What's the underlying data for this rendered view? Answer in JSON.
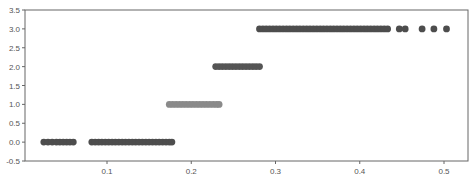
{
  "chart_data": {
    "type": "scatter",
    "title": "",
    "xlabel": "",
    "ylabel": "",
    "xlim": [
      0.0,
      0.53
    ],
    "ylim": [
      -0.5,
      3.5
    ],
    "grid": false,
    "legend": null,
    "x_ticks": [
      0.1,
      0.2,
      0.3,
      0.4,
      0.5
    ],
    "x_tick_labels": [
      "0.1",
      "0.2",
      "0.3",
      "0.4",
      "0.5"
    ],
    "y_ticks": [
      -0.5,
      0.0,
      0.5,
      1.0,
      1.5,
      2.0,
      2.5,
      3.0,
      3.5
    ],
    "y_tick_labels": [
      "-0.5",
      "0.0",
      "0.5",
      "1.0",
      "1.5",
      "2.0",
      "2.5",
      "3.0",
      "3.5"
    ],
    "series": [
      {
        "name": "class 0",
        "color": "#4d4d4d",
        "y": 0,
        "x": [
          0.025,
          0.03,
          0.035,
          0.04,
          0.044,
          0.048,
          0.052,
          0.056,
          0.06,
          0.082,
          0.086,
          0.09,
          0.094,
          0.098,
          0.102,
          0.106,
          0.11,
          0.114,
          0.118,
          0.122,
          0.126,
          0.13,
          0.134,
          0.138,
          0.142,
          0.146,
          0.15,
          0.154,
          0.158,
          0.162,
          0.166,
          0.17,
          0.174,
          0.177
        ]
      },
      {
        "name": "class 1",
        "color": "#8a8a8a",
        "y": 1,
        "x": [
          0.174,
          0.178,
          0.182,
          0.186,
          0.19,
          0.194,
          0.198,
          0.202,
          0.206,
          0.21,
          0.214,
          0.218,
          0.222,
          0.226,
          0.23,
          0.233
        ]
      },
      {
        "name": "class 2",
        "color": "#555555",
        "y": 2,
        "x": [
          0.229,
          0.233,
          0.237,
          0.241,
          0.245,
          0.249,
          0.253,
          0.257,
          0.261,
          0.265,
          0.269,
          0.273,
          0.277,
          0.281
        ]
      },
      {
        "name": "class 3",
        "color": "#4d4d4d",
        "y": 3,
        "x": [
          0.281,
          0.285,
          0.289,
          0.293,
          0.297,
          0.301,
          0.305,
          0.309,
          0.313,
          0.317,
          0.321,
          0.325,
          0.329,
          0.333,
          0.337,
          0.341,
          0.345,
          0.349,
          0.353,
          0.357,
          0.361,
          0.365,
          0.369,
          0.373,
          0.377,
          0.381,
          0.385,
          0.389,
          0.393,
          0.397,
          0.401,
          0.405,
          0.409,
          0.413,
          0.417,
          0.421,
          0.425,
          0.429,
          0.433,
          0.447,
          0.454,
          0.474,
          0.488,
          0.503
        ]
      }
    ]
  },
  "plot": {
    "frame_color": "#666666",
    "background": "#ffffff",
    "marker_radius": 3.4
  }
}
